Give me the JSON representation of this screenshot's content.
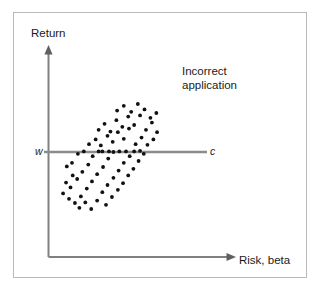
{
  "figure": {
    "title": "",
    "background_color": "#ffffff",
    "frame_color": "#b9b9b9",
    "axis_color": "#808080",
    "dot_color": "#111111",
    "line_color": "#8c8c8c"
  },
  "axes": {
    "y_label": "Return",
    "x_label": "Risk, beta"
  },
  "annotations": {
    "incorrect_application": "Incorrect\napplication",
    "incorrect_application_line1": "Incorrect",
    "incorrect_application_line2": "application"
  },
  "reference_line": {
    "left_label": "w",
    "right_label": "c"
  },
  "chart_data": {
    "type": "scatter",
    "title": "",
    "xlabel": "Risk, beta",
    "ylabel": "Return",
    "xlim": [
      0,
      100
    ],
    "ylim": [
      0,
      100
    ],
    "grid": false,
    "legend": null,
    "annotations": [
      {
        "text": "Incorrect application",
        "x": 84,
        "y": 86
      },
      {
        "text": "w",
        "x": -3,
        "y": 50,
        "note": "left end label of horizontal reference line"
      },
      {
        "text": "c",
        "x": 103,
        "y": 50,
        "note": "right end label of horizontal reference line"
      }
    ],
    "reference_lines": [
      {
        "orientation": "horizontal",
        "y": 50,
        "x_start": 0,
        "x_end": 100,
        "label_left": "w",
        "label_right": "c",
        "color": "#8c8c8c"
      }
    ],
    "series": [
      {
        "name": "portfolios",
        "marker": "filled-circle",
        "color": "#111111",
        "points": [
          [
            10.0,
            38.0
          ],
          [
            13.5,
            41.0
          ],
          [
            17.5,
            48.5
          ],
          [
            21.5,
            50.5
          ],
          [
            14.0,
            30.5
          ],
          [
            9.5,
            24.5
          ],
          [
            12.5,
            20.5
          ],
          [
            17.0,
            27.5
          ],
          [
            20.5,
            33.5
          ],
          [
            24.5,
            39.5
          ],
          [
            27.5,
            46.5
          ],
          [
            31.5,
            50.5
          ],
          [
            7.5,
            15.5
          ],
          [
            11.5,
            11.0
          ],
          [
            15.5,
            7.5
          ],
          [
            19.5,
            13.0
          ],
          [
            23.5,
            19.5
          ],
          [
            27.0,
            25.5
          ],
          [
            30.5,
            31.5
          ],
          [
            34.5,
            37.5
          ],
          [
            38.0,
            44.5
          ],
          [
            41.5,
            50.0
          ],
          [
            45.5,
            50.5
          ],
          [
            50.0,
            50.5
          ],
          [
            18.5,
            3.5
          ],
          [
            22.5,
            8.0
          ],
          [
            26.5,
            2.5
          ],
          [
            30.5,
            9.5
          ],
          [
            34.0,
            16.5
          ],
          [
            37.5,
            22.5
          ],
          [
            41.5,
            28.5
          ],
          [
            45.0,
            34.5
          ],
          [
            48.5,
            41.0
          ],
          [
            52.5,
            46.5
          ],
          [
            36.5,
            6.0
          ],
          [
            40.5,
            12.5
          ],
          [
            44.5,
            18.5
          ],
          [
            48.0,
            24.0
          ],
          [
            51.5,
            30.5
          ],
          [
            55.0,
            36.0
          ],
          [
            58.5,
            42.5
          ],
          [
            62.0,
            48.5
          ],
          [
            25.0,
            56.5
          ],
          [
            29.5,
            60.5
          ],
          [
            33.0,
            55.5
          ],
          [
            37.5,
            63.5
          ],
          [
            41.0,
            58.5
          ],
          [
            44.5,
            66.5
          ],
          [
            48.5,
            61.0
          ],
          [
            52.0,
            69.5
          ],
          [
            31.5,
            68.5
          ],
          [
            35.5,
            73.5
          ],
          [
            39.5,
            67.0
          ],
          [
            43.5,
            76.5
          ],
          [
            47.5,
            71.0
          ],
          [
            51.5,
            79.5
          ],
          [
            55.5,
            72.5
          ],
          [
            59.5,
            80.5
          ],
          [
            44.0,
            84.5
          ],
          [
            48.5,
            88.5
          ],
          [
            53.5,
            83.5
          ],
          [
            58.0,
            90.0
          ],
          [
            62.5,
            85.5
          ],
          [
            66.5,
            78.5
          ],
          [
            63.5,
            68.5
          ],
          [
            67.5,
            74.5
          ],
          [
            71.0,
            66.5
          ],
          [
            70.5,
            82.5
          ],
          [
            56.5,
            56.5
          ],
          [
            60.5,
            62.0
          ],
          [
            64.5,
            56.0
          ],
          [
            68.5,
            60.5
          ],
          [
            55.5,
            50.5
          ],
          [
            59.5,
            51.0
          ],
          [
            34.0,
            50.5
          ],
          [
            38.5,
            50.5
          ]
        ]
      }
    ]
  }
}
